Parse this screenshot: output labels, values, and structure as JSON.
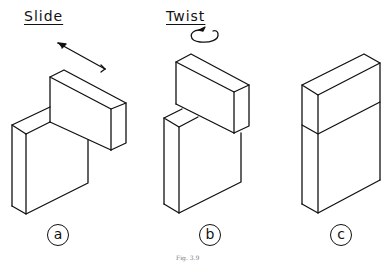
{
  "figure": {
    "caption": "Fig. 3.9",
    "panels": [
      {
        "id": "a",
        "label": "Slide",
        "marker": "a",
        "motion_icon": "straight-arrow"
      },
      {
        "id": "b",
        "label": "Twist",
        "marker": "b",
        "motion_icon": "rotation-arrow"
      },
      {
        "id": "c",
        "label": "",
        "marker": "c",
        "motion_icon": ""
      }
    ]
  }
}
